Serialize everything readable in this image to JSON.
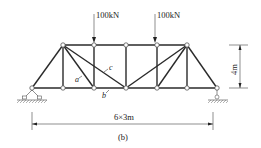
{
  "figure": {
    "caption": "(b)",
    "loads": [
      {
        "label": "100kN",
        "node": "T2"
      },
      {
        "label": "100kN",
        "node": "T4"
      }
    ],
    "member_labels": [
      {
        "text": "a",
        "member": "T1-B2"
      },
      {
        "text": "b",
        "member": "B2-B3"
      },
      {
        "text": "c",
        "member": "T1-B3"
      }
    ],
    "dimensions": {
      "height": "4m",
      "span": "6×3m"
    },
    "supports": {
      "left": "pin",
      "right": "roller"
    },
    "nodes": {
      "bottom": [
        "B0",
        "B1",
        "B2",
        "B3",
        "B4",
        "B5",
        "B6"
      ],
      "top": [
        "T1",
        "T2",
        "T3",
        "T4",
        "T5"
      ]
    }
  }
}
